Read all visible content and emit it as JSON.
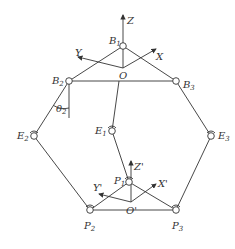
{
  "diagram": {
    "type": "parallel-mechanism-schematic",
    "base_frame": {
      "origin_label": "O",
      "axes": [
        {
          "label": "Z"
        },
        {
          "label": "X"
        },
        {
          "label": "Y"
        }
      ]
    },
    "platform_frame": {
      "origin_label": "O'",
      "axes": [
        {
          "label": "Z'"
        },
        {
          "label": "X'"
        },
        {
          "label": "Y'"
        }
      ]
    },
    "joints": {
      "B1": {
        "base": "B",
        "sub": "1"
      },
      "B2": {
        "base": "B",
        "sub": "2"
      },
      "B3": {
        "base": "B",
        "sub": "3"
      },
      "E1": {
        "base": "E",
        "sub": "1"
      },
      "E2": {
        "base": "E",
        "sub": "2"
      },
      "E3": {
        "base": "E",
        "sub": "3"
      },
      "P1": {
        "base": "P",
        "sub": "1"
      },
      "P2": {
        "base": "P",
        "sub": "2"
      },
      "P3": {
        "base": "P",
        "sub": "3"
      }
    },
    "angle": {
      "base": "θ",
      "sub": "2"
    }
  }
}
